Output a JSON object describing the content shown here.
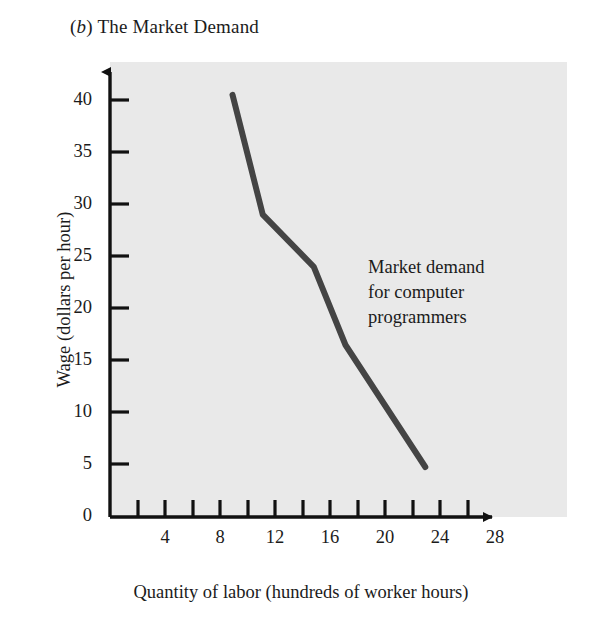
{
  "figure": {
    "panel_letter": "b",
    "panel_title": "The Market Demand",
    "title_prefix": "(",
    "title_suffix": ")"
  },
  "chart_data": {
    "type": "line",
    "title": "(b) The Market Demand",
    "xlabel": "Quantity of labor (hundreds of worker hours)",
    "ylabel": "Wage (dollars per hour)",
    "xlim": [
      0,
      30
    ],
    "ylim": [
      0,
      42
    ],
    "grid": false,
    "legend": "none",
    "annotations": [
      {
        "text_lines": [
          "Market demand",
          "for computer",
          "programmers"
        ],
        "x": 19.0,
        "y": 22.5
      }
    ],
    "xticks": [
      0,
      2,
      4,
      6,
      8,
      10,
      12,
      14,
      16,
      18,
      20,
      22,
      24,
      26,
      28
    ],
    "xtick_labels": [
      "",
      "",
      "4",
      "",
      "8",
      "",
      "12",
      "",
      "16",
      "",
      "20",
      "",
      "24",
      "",
      "28"
    ],
    "yticks": [
      0,
      5,
      10,
      15,
      20,
      25,
      30,
      35,
      40
    ],
    "ytick_labels": [
      "0",
      "5",
      "10",
      "15",
      "20",
      "25",
      "30",
      "35",
      "40"
    ],
    "series": [
      {
        "name": "Market demand for computer programmers",
        "color": "#444444",
        "linewidth": 6,
        "x": [
          8.9,
          11.1,
          14.8,
          17.1,
          22.9
        ],
        "y": [
          40.5,
          29.0,
          24.0,
          16.5,
          4.8
        ]
      }
    ]
  },
  "axes": {
    "y_title": "Wage (dollars per hour)",
    "x_title": "Quantity of labor (hundreds of worker hours)"
  },
  "colors": {
    "plot_background": "#e9e9e9",
    "page_background": "#ffffff",
    "axis": "#111111",
    "curve": "#444444",
    "text": "#1b1b1b"
  }
}
